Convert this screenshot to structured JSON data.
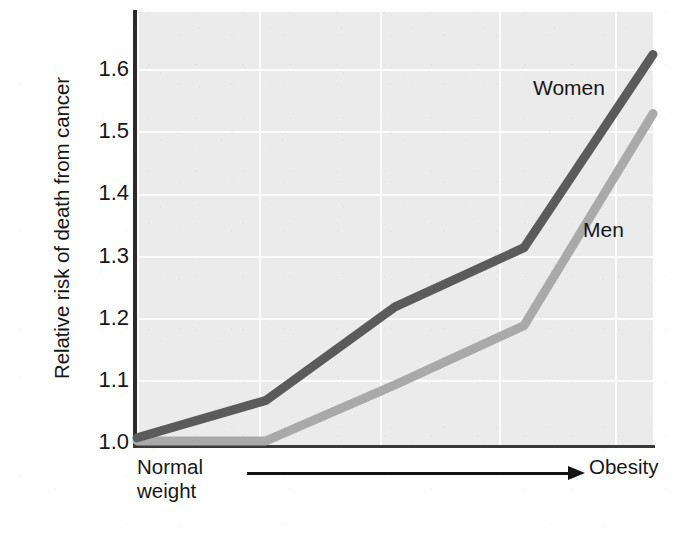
{
  "chart_data": {
    "type": "line",
    "title": "",
    "subtitle": "",
    "xlabel": "",
    "ylabel": "Relative risk of death from cancer",
    "x_axis_left_label_line1": "Normal",
    "x_axis_left_label_line2": "weight",
    "x_axis_right_label": "Obesity",
    "x_axis_arrow": "arrow pointing right from Normal weight to Obesity",
    "x": [
      0,
      1,
      2,
      3,
      4
    ],
    "x_tick_labels": [
      "",
      "",
      "",
      "",
      ""
    ],
    "ylim": [
      0.97,
      1.67
    ],
    "y_tick_labels": [
      "1.6",
      "1.5",
      "1.4",
      "1.3",
      "1.2",
      "1.1",
      "1.0"
    ],
    "y_ticks": [
      1.6,
      1.5,
      1.4,
      1.3,
      1.2,
      1.1,
      1.0
    ],
    "grid": "horizontal and vertical white gridlines on light gray panel",
    "legend_position": "inline labels next to lines",
    "series": [
      {
        "name": "Women",
        "color": "#5b5b5b",
        "values": [
          1.01,
          1.07,
          1.22,
          1.315,
          1.625
        ]
      },
      {
        "name": "Men",
        "color": "#a9a9a9",
        "values": [
          1.005,
          1.005,
          1.095,
          1.19,
          1.53
        ]
      }
    ],
    "annotations": [
      {
        "text": "Women",
        "series": "Women"
      },
      {
        "text": "Men",
        "series": "Men"
      }
    ],
    "colors": {
      "panel_background": "#ebebeb",
      "gridline": "#fbfbfb",
      "axis": "#2b2b2b",
      "text": "#171717",
      "women_line": "#5b5b5b",
      "men_line": "#a9a9a9"
    }
  }
}
